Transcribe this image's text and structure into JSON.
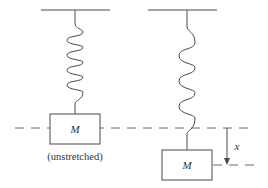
{
  "diagram": {
    "title": "",
    "left_system": {
      "mass_label": "M",
      "caption": "(unstretched)",
      "spring_coils": 4
    },
    "right_system": {
      "mass_label": "M",
      "spring_coils": 3,
      "displacement_label": "x"
    },
    "colors": {
      "stroke": "#4a4a4a",
      "dash": "#6a6a6a",
      "text": "#333333",
      "background": "#ffffff"
    }
  }
}
